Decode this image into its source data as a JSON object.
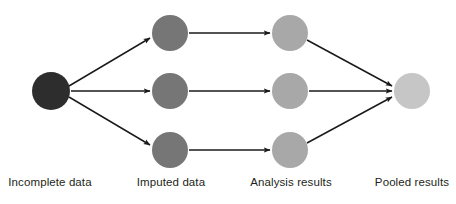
{
  "diagram": {
    "background_color": "#ffffff",
    "arrow_color": "#1a1a1a",
    "label_color": "#231f20",
    "stages": [
      {
        "id": "incomplete-data",
        "label": "Incomplete data",
        "label_x": 50,
        "label_y": 176,
        "node_color": "#2d2d2d",
        "nodes": [
          {
            "id": "incomplete-1",
            "cx": 51,
            "cy": 91,
            "r": 19
          }
        ]
      },
      {
        "id": "imputed-data",
        "label": "Imputed data",
        "label_x": 171,
        "label_y": 176,
        "node_color": "#767676",
        "nodes": [
          {
            "id": "imputed-1",
            "cx": 170,
            "cy": 33,
            "r": 18
          },
          {
            "id": "imputed-2",
            "cx": 170,
            "cy": 91,
            "r": 18
          },
          {
            "id": "imputed-3",
            "cx": 170,
            "cy": 150,
            "r": 18
          }
        ]
      },
      {
        "id": "analysis-results",
        "label": "Analysis results",
        "label_x": 291,
        "label_y": 176,
        "node_color": "#a8a8a8",
        "nodes": [
          {
            "id": "analysis-1",
            "cx": 290,
            "cy": 33,
            "r": 18
          },
          {
            "id": "analysis-2",
            "cx": 290,
            "cy": 91,
            "r": 18
          },
          {
            "id": "analysis-3",
            "cx": 290,
            "cy": 150,
            "r": 18
          }
        ]
      },
      {
        "id": "pooled-results",
        "label": "Pooled results",
        "label_x": 412,
        "label_y": 176,
        "node_color": "#c6c6c6",
        "nodes": [
          {
            "id": "pooled-1",
            "cx": 412,
            "cy": 91,
            "r": 18
          }
        ]
      }
    ],
    "edges": [
      {
        "id": "edge-incomplete-imputed-1",
        "from": "incomplete-1",
        "to": "imputed-1",
        "x1": 69,
        "y1": 86,
        "x2": 150,
        "y2": 38
      },
      {
        "id": "edge-incomplete-imputed-2",
        "from": "incomplete-1",
        "to": "imputed-2",
        "x1": 71,
        "y1": 91,
        "x2": 150,
        "y2": 91
      },
      {
        "id": "edge-incomplete-imputed-3",
        "from": "incomplete-1",
        "to": "imputed-3",
        "x1": 69,
        "y1": 97,
        "x2": 150,
        "y2": 145
      },
      {
        "id": "edge-imputed-analysis-1",
        "from": "imputed-1",
        "to": "analysis-1",
        "x1": 189,
        "y1": 33,
        "x2": 270,
        "y2": 33
      },
      {
        "id": "edge-imputed-analysis-2",
        "from": "imputed-2",
        "to": "analysis-2",
        "x1": 189,
        "y1": 91,
        "x2": 270,
        "y2": 91
      },
      {
        "id": "edge-imputed-analysis-3",
        "from": "imputed-3",
        "to": "analysis-3",
        "x1": 189,
        "y1": 150,
        "x2": 270,
        "y2": 150
      },
      {
        "id": "edge-analysis-pooled-1",
        "from": "analysis-1",
        "to": "pooled-1",
        "x1": 307,
        "y1": 40,
        "x2": 392,
        "y2": 86
      },
      {
        "id": "edge-analysis-pooled-2",
        "from": "analysis-2",
        "to": "pooled-1",
        "x1": 309,
        "y1": 91,
        "x2": 392,
        "y2": 91
      },
      {
        "id": "edge-analysis-pooled-3",
        "from": "analysis-3",
        "to": "pooled-1",
        "x1": 307,
        "y1": 143,
        "x2": 392,
        "y2": 97
      }
    ]
  }
}
